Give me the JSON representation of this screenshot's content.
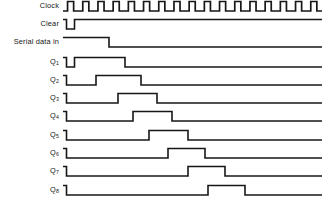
{
  "diagram": {
    "type": "digital-timing-waveform",
    "line_color": "#171717",
    "background_color": "#ffffff",
    "label_color": "#151515"
  },
  "axis": {
    "wave_start_x": 63,
    "wave_end_x": 322,
    "clock_period": 15.2,
    "clock_count": 17,
    "high_level_offset": -9.5,
    "row_spacing": 18.4,
    "first_row_baseline": 11
  },
  "rows": [
    {
      "name": "clock",
      "label": "Clock",
      "sublabel": "",
      "baseline_y": 11,
      "kind": "clock"
    },
    {
      "name": "clear",
      "label": "Clear",
      "sublabel": "",
      "baseline_y": 29,
      "kind": "signal",
      "initial": "high",
      "transitions": [
        66.5,
        74.5
      ]
    },
    {
      "name": "serial-data-in",
      "label": "Serial data in",
      "sublabel": "",
      "baseline_y": 47,
      "kind": "signal",
      "initial": "high",
      "transitions": [
        109
      ]
    },
    {
      "name": "q1",
      "label": "Q",
      "sublabel": "1",
      "baseline_y": 67,
      "kind": "signal",
      "initial": "high",
      "transitions": [
        66.5,
        74.5,
        125
      ]
    },
    {
      "name": "q2",
      "label": "Q",
      "sublabel": "2",
      "baseline_y": 85,
      "kind": "signal",
      "initial": "high",
      "transitions": [
        66.5,
        96,
        141
      ]
    },
    {
      "name": "q3",
      "label": "Q",
      "sublabel": "3",
      "baseline_y": 103,
      "kind": "signal",
      "initial": "high",
      "transitions": [
        66.5,
        118,
        157
      ]
    },
    {
      "name": "q4",
      "label": "Q",
      "sublabel": "4",
      "baseline_y": 121,
      "kind": "signal",
      "initial": "high",
      "transitions": [
        66.5,
        133,
        172
      ]
    },
    {
      "name": "q5",
      "label": "Q",
      "sublabel": "5",
      "baseline_y": 140,
      "kind": "signal",
      "initial": "high",
      "transitions": [
        66.5,
        149,
        188
      ]
    },
    {
      "name": "q6",
      "label": "Q",
      "sublabel": "6",
      "baseline_y": 158,
      "kind": "signal",
      "initial": "high",
      "transitions": [
        66.5,
        168,
        205
      ]
    },
    {
      "name": "q7",
      "label": "Q",
      "sublabel": "7",
      "baseline_y": 176,
      "kind": "signal",
      "initial": "high",
      "transitions": [
        66.5,
        188,
        225
      ]
    },
    {
      "name": "q8",
      "label": "Q",
      "sublabel": "8",
      "baseline_y": 195,
      "kind": "signal",
      "initial": "high",
      "transitions": [
        66.5,
        208,
        245
      ]
    }
  ],
  "chart_data": {
    "type": "timing-diagram",
    "xlabel": "time (clock cycles)",
    "ylabel": "",
    "signals": [
      {
        "name": "Clock",
        "description": "Free running square wave, 17 pulses across the trace",
        "pulses": 17
      },
      {
        "name": "Clear",
        "description": "Idles high, one short active-low clear pulse at the very start",
        "low_intervals": [
          [
            0.2,
            0.75
          ]
        ]
      },
      {
        "name": "Serial data in",
        "description": "High from the start, falls low after about 3 clock periods and stays low",
        "high_intervals": [
          [
            0,
            3.0
          ]
        ]
      },
      {
        "name": "Q1",
        "description": "Cleared low, then high for the first 3 clock periods, then low",
        "high_intervals": [
          [
            0.75,
            4.1
          ]
        ]
      },
      {
        "name": "Q2",
        "description": "Data delayed one clock relative to Q1",
        "high_intervals": [
          [
            2.2,
            5.1
          ]
        ]
      },
      {
        "name": "Q3",
        "description": "Data delayed two clocks relative to Q1",
        "high_intervals": [
          [
            3.6,
            6.2
          ]
        ]
      },
      {
        "name": "Q4",
        "description": "Data delayed three clocks relative to Q1",
        "high_intervals": [
          [
            4.6,
            7.2
          ]
        ]
      },
      {
        "name": "Q5",
        "description": "Data delayed four clocks relative to Q1",
        "high_intervals": [
          [
            5.7,
            8.2
          ]
        ]
      },
      {
        "name": "Q6",
        "description": "Data delayed five clocks relative to Q1",
        "high_intervals": [
          [
            6.9,
            9.3
          ]
        ]
      },
      {
        "name": "Q7",
        "description": "Data delayed six clocks relative to Q1",
        "high_intervals": [
          [
            8.2,
            10.7
          ]
        ]
      },
      {
        "name": "Q8",
        "description": "Data delayed seven clocks relative to Q1",
        "high_intervals": [
          [
            9.5,
            12.0
          ]
        ]
      }
    ],
    "grid": false,
    "legend": "none"
  }
}
